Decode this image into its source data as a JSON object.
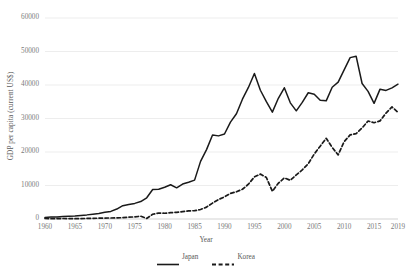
{
  "chart_data": {
    "type": "line",
    "title": "",
    "xlabel": "Year",
    "ylabel": "GDP per capita (current US$)",
    "xlim": [
      1960,
      2019
    ],
    "ylim": [
      0,
      60000
    ],
    "grid": "horizontal",
    "legend_position": "bottom-center",
    "x_ticks": [
      "1960",
      "1965",
      "1970",
      "1975",
      "1980",
      "1985",
      "1990",
      "1995",
      "2000",
      "2005",
      "2010",
      "2015",
      "2019"
    ],
    "y_ticks": [
      "0",
      "10000",
      "20000",
      "30000",
      "40000",
      "50000",
      "60000"
    ],
    "x": [
      1960,
      1961,
      1962,
      1963,
      1964,
      1965,
      1966,
      1967,
      1968,
      1969,
      1970,
      1971,
      1972,
      1973,
      1974,
      1975,
      1976,
      1977,
      1978,
      1979,
      1980,
      1981,
      1982,
      1983,
      1984,
      1985,
      1986,
      1987,
      1988,
      1989,
      1990,
      1991,
      1992,
      1993,
      1994,
      1995,
      1996,
      1997,
      1998,
      1999,
      2000,
      2001,
      2002,
      2003,
      2004,
      2005,
      2006,
      2007,
      2008,
      2009,
      2010,
      2011,
      2012,
      2013,
      2014,
      2015,
      2016,
      2017,
      2018,
      2019
    ],
    "series": [
      {
        "name": "Japan",
        "style": "solid",
        "color": "#1a1a1a",
        "values": [
          479,
          563,
          634,
          718,
          836,
          920,
          1059,
          1229,
          1451,
          1669,
          2038,
          2272,
          2967,
          3976,
          4354,
          4659,
          5198,
          6336,
          8822,
          8903,
          9465,
          10212,
          9302,
          10426,
          10986,
          11602,
          17197,
          20716,
          25059,
          24813,
          25371,
          28915,
          31403,
          35766,
          39269,
          43440,
          38437,
          35022,
          31903,
          36027,
          39173,
          34674,
          32289,
          34808,
          37689,
          37218,
          35434,
          35275,
          39339,
          40855,
          44508,
          48168,
          48603,
          40454,
          38109,
          34524,
          38762,
          38387,
          39159,
          40247
        ]
      },
      {
        "name": "Korea",
        "style": "dashed",
        "color": "#1a1a1a",
        "values": [
          158,
          94,
          106,
          146,
          124,
          110,
          134,
          161,
          198,
          243,
          279,
          301,
          324,
          407,
          563,
          617,
          834,
          150,
          1406,
          1784,
          1715,
          1883,
          1992,
          2198,
          2413,
          2482,
          2835,
          3555,
          4749,
          5817,
          6610,
          7637,
          8127,
          8884,
          10385,
          12565,
          13403,
          12398,
          8282,
          10672,
          12257,
          11561,
          13165,
          14673,
          16496,
          19403,
          21743,
          24086,
          21350,
          19144,
          23087,
          25096,
          25467,
          27183,
          29252,
          28732,
          29289,
          31617,
          33447,
          31846
        ]
      }
    ]
  },
  "axis": {
    "ylabel": "GDP per capita (current US$)",
    "xlabel": "Year"
  },
  "legend": {
    "items": [
      {
        "label": "Japan",
        "style": "solid"
      },
      {
        "label": "Korea",
        "style": "dashed"
      }
    ]
  }
}
